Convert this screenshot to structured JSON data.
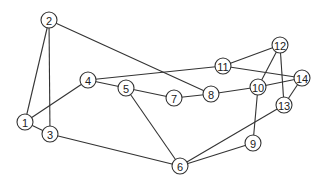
{
  "diagram": {
    "type": "undirected-graph",
    "nodes": [
      {
        "id": "1",
        "label": "1",
        "x": 25,
        "y": 122
      },
      {
        "id": "2",
        "label": "2",
        "x": 49,
        "y": 20
      },
      {
        "id": "3",
        "label": "3",
        "x": 50,
        "y": 134
      },
      {
        "id": "4",
        "label": "4",
        "x": 88,
        "y": 80
      },
      {
        "id": "5",
        "label": "5",
        "x": 126,
        "y": 88
      },
      {
        "id": "6",
        "label": "6",
        "x": 180,
        "y": 166
      },
      {
        "id": "7",
        "label": "7",
        "x": 174,
        "y": 98
      },
      {
        "id": "8",
        "label": "8",
        "x": 211,
        "y": 94
      },
      {
        "id": "9",
        "label": "9",
        "x": 253,
        "y": 143
      },
      {
        "id": "10",
        "label": "10",
        "x": 258,
        "y": 87
      },
      {
        "id": "11",
        "label": "11",
        "x": 223,
        "y": 66
      },
      {
        "id": "12",
        "label": "12",
        "x": 280,
        "y": 45
      },
      {
        "id": "13",
        "label": "13",
        "x": 284,
        "y": 105
      },
      {
        "id": "14",
        "label": "14",
        "x": 302,
        "y": 78
      }
    ],
    "edges": [
      [
        "1",
        "2"
      ],
      [
        "1",
        "3"
      ],
      [
        "1",
        "4"
      ],
      [
        "2",
        "3"
      ],
      [
        "2",
        "8"
      ],
      [
        "3",
        "6"
      ],
      [
        "4",
        "5"
      ],
      [
        "4",
        "11"
      ],
      [
        "5",
        "7"
      ],
      [
        "5",
        "6"
      ],
      [
        "7",
        "8"
      ],
      [
        "8",
        "10"
      ],
      [
        "10",
        "12"
      ],
      [
        "10",
        "14"
      ],
      [
        "10",
        "9"
      ],
      [
        "11",
        "12"
      ],
      [
        "11",
        "14"
      ],
      [
        "12",
        "13"
      ],
      [
        "13",
        "14"
      ],
      [
        "13",
        "6"
      ],
      [
        "9",
        "6"
      ]
    ],
    "node_radius": 8,
    "colors": {
      "stroke": "#333333",
      "fill": "#ffffff",
      "text": "#222222"
    }
  }
}
